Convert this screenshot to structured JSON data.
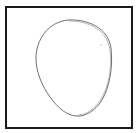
{
  "drawing": {
    "subject": "egg-shaped oval outline sketch",
    "frame_color": "#1a1a1a",
    "stroke_color": "#6e6e6e",
    "background": "#ffffff"
  }
}
